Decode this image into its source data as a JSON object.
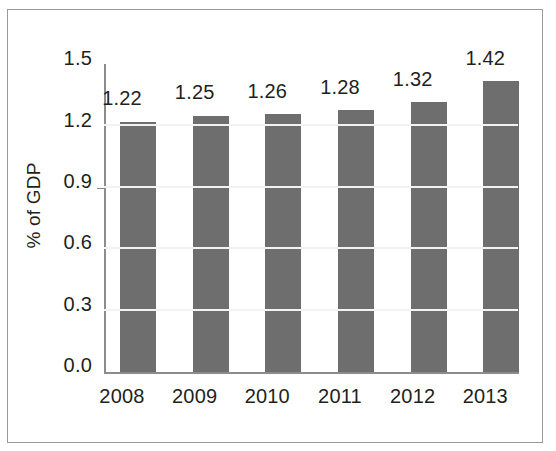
{
  "chart_data": {
    "type": "bar",
    "title": "",
    "subtitle": "",
    "xlabel": "",
    "ylabel": "% of GDP",
    "categories": [
      "2008",
      "2009",
      "2010",
      "2011",
      "2012",
      "2013"
    ],
    "values": [
      1.22,
      1.25,
      1.26,
      1.28,
      1.32,
      1.42
    ],
    "value_labels": [
      "1.22",
      "1.25",
      "1.26",
      "1.28",
      "1.32",
      "1.42"
    ],
    "ylim": [
      0.0,
      1.5
    ],
    "ytick_labels": [
      "0.0",
      "0.3",
      "0.6",
      "0.9",
      "1.2",
      "1.5"
    ],
    "ytick_values": [
      0.0,
      0.3,
      0.6,
      0.9,
      1.2,
      1.5
    ],
    "grid": true,
    "gridline_color": "#f2f2f2",
    "legend": null,
    "legend_position": "none",
    "bar_color": "#6e6e6e",
    "axis_color": "#8c8c8c",
    "text_color": "#231f20",
    "background_color": "#ffffff",
    "frame_border_color": "#9a9a9a",
    "series": [
      {
        "name": "% of GDP",
        "values": [
          1.22,
          1.25,
          1.26,
          1.28,
          1.32,
          1.42
        ]
      }
    ]
  }
}
